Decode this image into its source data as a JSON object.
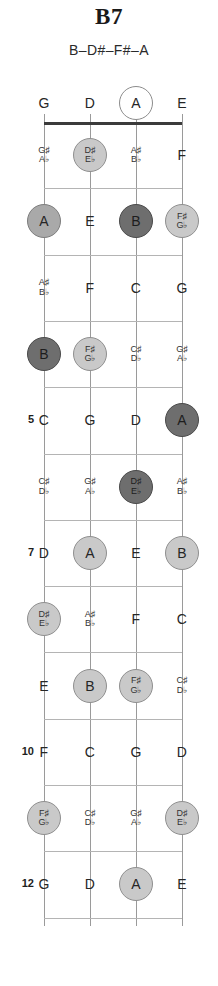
{
  "title": "B7",
  "notes_line": "B–D#–F#–A",
  "colors": {
    "nut": "#3b3b3b",
    "fret_line": "#b4b4b4",
    "string_line": "#9a9a9a",
    "marker_open": "#ffffff",
    "marker_light": "#c9c9c9",
    "marker_mid": "#a9a9a9",
    "marker_dark": "#6e6e6e",
    "text": "#262626"
  },
  "diagram": {
    "instrument": "bass-fretboard",
    "strings": [
      "G",
      "D",
      "A",
      "E"
    ],
    "fret_count": 12,
    "fret_number_labels": [
      "5",
      "7",
      "10",
      "12"
    ],
    "chord_tones": [
      "B",
      "D#",
      "F#",
      "A"
    ]
  },
  "rows": [
    {
      "fret": 0,
      "label": "",
      "cells": [
        {
          "nat": "G",
          "acc": "",
          "marker": "none"
        },
        {
          "nat": "D",
          "acc": "",
          "marker": "none"
        },
        {
          "nat": "A",
          "acc": "",
          "marker": "open"
        },
        {
          "nat": "E",
          "acc": "",
          "marker": "none"
        }
      ]
    },
    {
      "fret": 1,
      "label": "",
      "cells": [
        {
          "nat": "",
          "acc": "G♯|A♭",
          "marker": "none"
        },
        {
          "nat": "",
          "acc": "D♯|E♭",
          "marker": "light"
        },
        {
          "nat": "",
          "acc": "A♯|B♭",
          "marker": "none"
        },
        {
          "nat": "F",
          "acc": "",
          "marker": "none"
        }
      ]
    },
    {
      "fret": 2,
      "label": "",
      "cells": [
        {
          "nat": "A",
          "acc": "",
          "marker": "mid"
        },
        {
          "nat": "E",
          "acc": "",
          "marker": "none"
        },
        {
          "nat": "B",
          "acc": "",
          "marker": "dark"
        },
        {
          "nat": "",
          "acc": "F♯|G♭",
          "marker": "light"
        }
      ]
    },
    {
      "fret": 3,
      "label": "",
      "cells": [
        {
          "nat": "",
          "acc": "A♯|B♭",
          "marker": "none"
        },
        {
          "nat": "F",
          "acc": "",
          "marker": "none"
        },
        {
          "nat": "C",
          "acc": "",
          "marker": "none"
        },
        {
          "nat": "G",
          "acc": "",
          "marker": "none"
        }
      ]
    },
    {
      "fret": 4,
      "label": "",
      "cells": [
        {
          "nat": "B",
          "acc": "",
          "marker": "dark"
        },
        {
          "nat": "",
          "acc": "F♯|G♭",
          "marker": "light"
        },
        {
          "nat": "",
          "acc": "C♯|D♭",
          "marker": "none"
        },
        {
          "nat": "",
          "acc": "G♯|A♭",
          "marker": "none"
        }
      ]
    },
    {
      "fret": 5,
      "label": "5",
      "cells": [
        {
          "nat": "C",
          "acc": "",
          "marker": "none"
        },
        {
          "nat": "G",
          "acc": "",
          "marker": "none"
        },
        {
          "nat": "D",
          "acc": "",
          "marker": "none"
        },
        {
          "nat": "A",
          "acc": "",
          "marker": "dark"
        }
      ]
    },
    {
      "fret": 6,
      "label": "",
      "cells": [
        {
          "nat": "",
          "acc": "C♯|D♭",
          "marker": "none"
        },
        {
          "nat": "",
          "acc": "G♯|A♭",
          "marker": "none"
        },
        {
          "nat": "",
          "acc": "D♯|E♭",
          "marker": "dark"
        },
        {
          "nat": "",
          "acc": "A♯|B♭",
          "marker": "none"
        }
      ]
    },
    {
      "fret": 7,
      "label": "7",
      "cells": [
        {
          "nat": "D",
          "acc": "",
          "marker": "none"
        },
        {
          "nat": "A",
          "acc": "",
          "marker": "light"
        },
        {
          "nat": "E",
          "acc": "",
          "marker": "none"
        },
        {
          "nat": "B",
          "acc": "",
          "marker": "light"
        }
      ]
    },
    {
      "fret": 8,
      "label": "",
      "cells": [
        {
          "nat": "",
          "acc": "D♯|E♭",
          "marker": "light"
        },
        {
          "nat": "",
          "acc": "A♯|B♭",
          "marker": "none"
        },
        {
          "nat": "F",
          "acc": "",
          "marker": "none"
        },
        {
          "nat": "C",
          "acc": "",
          "marker": "none"
        }
      ]
    },
    {
      "fret": 9,
      "label": "",
      "cells": [
        {
          "nat": "E",
          "acc": "",
          "marker": "none"
        },
        {
          "nat": "B",
          "acc": "",
          "marker": "light"
        },
        {
          "nat": "",
          "acc": "F♯|G♭",
          "marker": "light"
        },
        {
          "nat": "",
          "acc": "C♯|D♭",
          "marker": "none"
        }
      ]
    },
    {
      "fret": 10,
      "label": "10",
      "cells": [
        {
          "nat": "F",
          "acc": "",
          "marker": "none"
        },
        {
          "nat": "C",
          "acc": "",
          "marker": "none"
        },
        {
          "nat": "G",
          "acc": "",
          "marker": "none"
        },
        {
          "nat": "D",
          "acc": "",
          "marker": "none"
        }
      ]
    },
    {
      "fret": 11,
      "label": "",
      "cells": [
        {
          "nat": "",
          "acc": "F♯|G♭",
          "marker": "light"
        },
        {
          "nat": "",
          "acc": "C♯|D♭",
          "marker": "none"
        },
        {
          "nat": "",
          "acc": "G♯|A♭",
          "marker": "none"
        },
        {
          "nat": "",
          "acc": "D♯|E♭",
          "marker": "light"
        }
      ]
    },
    {
      "fret": 12,
      "label": "12",
      "cells": [
        {
          "nat": "G",
          "acc": "",
          "marker": "none"
        },
        {
          "nat": "D",
          "acc": "",
          "marker": "none"
        },
        {
          "nat": "A",
          "acc": "",
          "marker": "light"
        },
        {
          "nat": "E",
          "acc": "",
          "marker": "none"
        }
      ]
    }
  ]
}
